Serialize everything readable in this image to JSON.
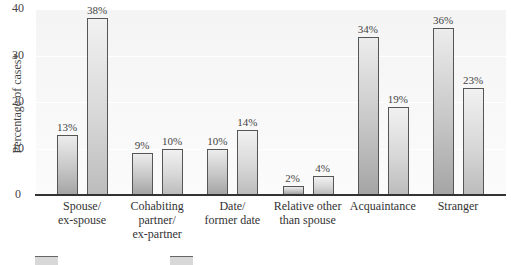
{
  "chart_data": {
    "type": "bar",
    "title": "",
    "xlabel": "",
    "ylabel": "Percentage of cases*",
    "ylim": [
      0,
      40
    ],
    "yticks": [
      0,
      10,
      20,
      30,
      40
    ],
    "grid": true,
    "categories": [
      "Spouse/\nex-spouse",
      "Cohabiting\npartner/\nex-partner",
      "Date/\nformer date",
      "Relative other\nthan spouse",
      "Acquaintance",
      "Stranger"
    ],
    "series": [
      {
        "name": "Series 1 (dark bars)",
        "values": [
          13,
          9,
          10,
          2,
          34,
          36
        ]
      },
      {
        "name": "Series 2 (light bars)",
        "values": [
          38,
          10,
          14,
          4,
          19,
          23
        ]
      }
    ],
    "value_labels": [
      [
        "13%",
        "9%",
        "10%",
        "2%",
        "34%",
        "36%"
      ],
      [
        "38%",
        "10%",
        "14%",
        "4%",
        "19%",
        "23%"
      ]
    ],
    "legend": {
      "position": "bottom-left",
      "visible_partially": true
    }
  },
  "axis": {
    "ylabel": "Percentage of cases*",
    "ticks": [
      "0",
      "10",
      "20",
      "30",
      "40"
    ]
  },
  "categories": [
    {
      "label": "Spouse/\nex-spouse",
      "v1": "13%",
      "v2": "38%"
    },
    {
      "label": "Cohabiting\npartner/\nex-partner",
      "v1": "9%",
      "v2": "10%"
    },
    {
      "label": "Date/\nformer date",
      "v1": "10%",
      "v2": "14%"
    },
    {
      "label": "Relative other\nthan spouse",
      "v1": "2%",
      "v2": "4%"
    },
    {
      "label": "Acquaintance",
      "v1": "34%",
      "v2": "19%"
    },
    {
      "label": "Stranger",
      "v1": "36%",
      "v2": "23%"
    }
  ]
}
